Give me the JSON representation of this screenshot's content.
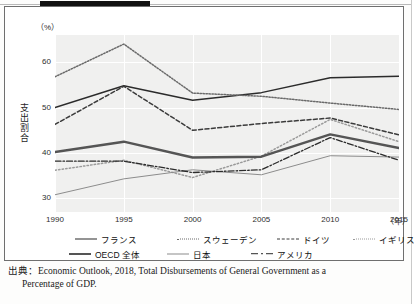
{
  "figure": {
    "unit_label": "（%）",
    "y_axis_title": "支出割合",
    "x_unit": "（年）"
  },
  "source": {
    "line1": "出典：Economic Outlook, 2018, Total Disbursements of General Government as a",
    "line2": "Percentage of GDP."
  },
  "legend": {
    "items": [
      {
        "label": "フランス",
        "style": "solid",
        "color": "#2b2b2b"
      },
      {
        "label": "スウェーデン",
        "style": "fine-dotted",
        "color": "#6a6a6a"
      },
      {
        "label": "ドイツ",
        "style": "dashed",
        "color": "#3b3b3b"
      },
      {
        "label": "イギリス",
        "style": "dotted",
        "color": "#9a9a9a"
      },
      {
        "label": "OECD 全体",
        "style": "thick-solid",
        "color": "#555555"
      },
      {
        "label": "日本",
        "style": "thin-solid",
        "color": "#8c8c8c"
      },
      {
        "label": "アメリカ",
        "style": "dash-dot",
        "color": "#2b2b2b"
      }
    ]
  },
  "chart_data": {
    "type": "line",
    "title": "",
    "xlabel": "（年）",
    "ylabel": "支出割合",
    "y_unit": "（%）",
    "categories": [
      1990,
      1995,
      2000,
      2005,
      2010,
      2015
    ],
    "x_tick_labels": [
      "1990",
      "1995",
      "2000",
      "2005",
      "2010",
      "2015"
    ],
    "y_tick_labels": [
      "30",
      "40",
      "50",
      "60"
    ],
    "y_ticks": [
      30,
      40,
      50,
      60
    ],
    "ylim": [
      27,
      66
    ],
    "xlim": [
      1990,
      2015
    ],
    "grid": true,
    "legend_position": "bottom",
    "series": [
      {
        "name": "フランス",
        "style": "solid",
        "color": "#2b2b2b",
        "values": [
          50.0,
          54.8,
          51.6,
          53.3,
          56.6,
          56.9
        ]
      },
      {
        "name": "スウェーデン",
        "style": "fine-dotted",
        "color": "#6a6a6a",
        "values": [
          56.8,
          64.0,
          53.2,
          52.5,
          51.0,
          49.6
        ]
      },
      {
        "name": "ドイツ",
        "style": "dashed",
        "color": "#3b3b3b",
        "values": [
          46.3,
          54.7,
          45.0,
          46.5,
          47.7,
          44.0
        ]
      },
      {
        "name": "イギリス",
        "style": "dotted",
        "color": "#9a9a9a",
        "values": [
          36.2,
          38.4,
          34.6,
          39.3,
          47.4,
          42.5
        ]
      },
      {
        "name": "OECD 全体",
        "style": "thick-solid",
        "color": "#555555",
        "values": [
          40.2,
          42.5,
          39.0,
          39.2,
          44.1,
          41.1
        ]
      },
      {
        "name": "日本",
        "style": "thin-solid",
        "color": "#8c8c8c",
        "values": [
          30.8,
          34.3,
          36.3,
          35.2,
          39.4,
          39.1
        ]
      },
      {
        "name": "アメリカ",
        "style": "dash-dot",
        "color": "#2b2b2b",
        "values": [
          38.2,
          38.2,
          35.7,
          36.3,
          43.4,
          38.4
        ]
      }
    ]
  }
}
